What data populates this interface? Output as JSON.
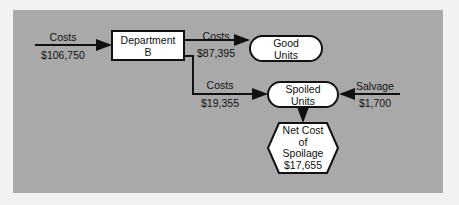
{
  "diagram": {
    "input": {
      "label": "Costs",
      "value": "$106,750"
    },
    "department": {
      "line1": "Department",
      "line2": "B"
    },
    "good_flow": {
      "label": "Costs",
      "value": "$87,395"
    },
    "good_units": {
      "line1": "Good",
      "line2": "Units"
    },
    "spoiled_flow": {
      "label": "Costs",
      "value": "$19,355"
    },
    "spoiled_units": {
      "line1": "Spoiled",
      "line2": "Units"
    },
    "salvage": {
      "label": "Salvage",
      "value": "$1,700"
    },
    "net_cost": {
      "line1": "Net Cost",
      "line2": "of",
      "line3": "Spoilage",
      "value": "$17,655"
    }
  },
  "colors": {
    "panel": "#a9a9a9",
    "background": "#f2f2f2",
    "line": "#111111",
    "node_fill": "#ffffff"
  }
}
